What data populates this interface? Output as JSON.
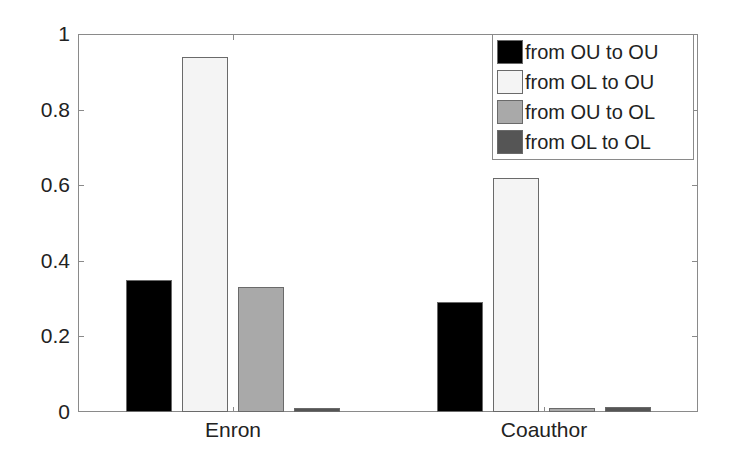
{
  "chart_data": {
    "type": "bar",
    "title": "",
    "xlabel": "",
    "ylabel": "",
    "ylim": [
      0,
      1
    ],
    "yticks": [
      "0",
      "0.2",
      "0.4",
      "0.6",
      "0.8",
      "1"
    ],
    "categories": [
      "Enron",
      "Coauthor"
    ],
    "series": [
      {
        "name": "from OU to OU",
        "color": "#000000",
        "values": [
          0.35,
          0.29
        ]
      },
      {
        "name": "from OL to OU",
        "color": "#f4f4f4",
        "values": [
          0.94,
          0.62
        ]
      },
      {
        "name": "from OU to OL",
        "color": "#a9a9a9",
        "values": [
          0.33,
          0.01
        ]
      },
      {
        "name": "from OL to OL",
        "color": "#555555",
        "values": [
          0.01,
          0.012
        ]
      }
    ],
    "legend_position": "upper right",
    "grid": false
  }
}
